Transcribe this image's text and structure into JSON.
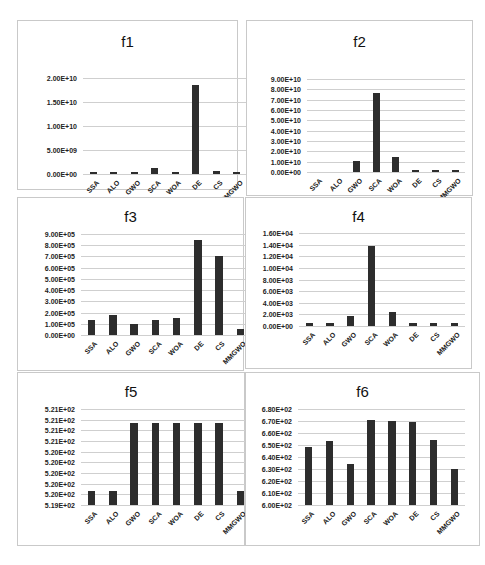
{
  "chart_data": [
    {
      "type": "bar",
      "title": "f1",
      "categories": [
        "SSA",
        "ALO",
        "GWO",
        "SCA",
        "WOA",
        "DE",
        "CS",
        "MMGWO"
      ],
      "values": [
        200000000.0,
        200000000.0,
        200000000.0,
        1200000000.0,
        200000000.0,
        18500000000.0,
        700000000.0,
        200000000.0
      ],
      "yticks": [
        "0.00E+00",
        "5.00E+09",
        "1.00E+10",
        "1.50E+10",
        "2.00E+10"
      ],
      "ylim": [
        0,
        20000000000.0
      ],
      "xlabel": "",
      "ylabel": "",
      "grid": true,
      "legend": null
    },
    {
      "type": "bar",
      "title": "f2",
      "categories": [
        "SSA",
        "ALO",
        "GWO",
        "SCA",
        "WOA",
        "DE",
        "CS",
        "MMGWO"
      ],
      "values": [
        0,
        0,
        10500000000.0,
        76000000000.0,
        15000000000.0,
        500000000.0,
        500000000.0,
        500000000.0
      ],
      "yticks": [
        "0.00E+00",
        "1.00E+10",
        "2.00E+10",
        "3.00E+10",
        "4.00E+10",
        "5.00E+10",
        "6.00E+10",
        "7.00E+10",
        "8.00E+10",
        "9.00E+10"
      ],
      "ylim": [
        0,
        90000000000.0
      ],
      "xlabel": "",
      "ylabel": "",
      "grid": true,
      "legend": null
    },
    {
      "type": "bar",
      "title": "f3",
      "categories": [
        "SSA",
        "ALO",
        "GWO",
        "SCA",
        "WOA",
        "DE",
        "CS",
        "MMGWO"
      ],
      "values": [
        135000.0,
        180000.0,
        95000.0,
        135000.0,
        150000.0,
        850000.0,
        705000.0,
        50000.0
      ],
      "yticks": [
        "0.00E+00",
        "1.00E+05",
        "2.00E+05",
        "3.00E+05",
        "4.00E+05",
        "5.00E+05",
        "6.00E+05",
        "7.00E+05",
        "8.00E+05",
        "9.00E+05"
      ],
      "ylim": [
        0,
        900000.0
      ],
      "xlabel": "",
      "ylabel": "",
      "grid": true,
      "legend": null
    },
    {
      "type": "bar",
      "title": "f4",
      "categories": [
        "SSA",
        "ALO",
        "GWO",
        "SCA",
        "WOA",
        "DE",
        "CS",
        "MMGWO"
      ],
      "values": [
        600,
        600,
        1800,
        13700,
        2400,
        600,
        600,
        450
      ],
      "yticks": [
        "0.00E+00",
        "2.00E+03",
        "4.00E+03",
        "6.00E+03",
        "8.00E+03",
        "1.00E+04",
        "1.20E+04",
        "1.40E+04",
        "1.60E+04"
      ],
      "ylim": [
        0,
        16000
      ],
      "xlabel": "",
      "ylabel": "",
      "grid": true,
      "legend": null
    },
    {
      "type": "bar",
      "title": "f5",
      "categories": [
        "SSA",
        "ALO",
        "GWO",
        "SCA",
        "WOA",
        "DE",
        "CS",
        "MMGWO"
      ],
      "values": [
        520.0,
        520.0,
        521.0,
        521.0,
        521.0,
        521.0,
        521.0,
        520.0
      ],
      "yticks": [
        "5.19E+02",
        "5.20E+02",
        "5.20E+02",
        "5.20E+02",
        "5.20E+02",
        "5.20E+02",
        "5.21E+02",
        "5.21E+02",
        "5.21E+02",
        "5.21E+02"
      ],
      "ylim": [
        519.8,
        521.2
      ],
      "xlabel": "",
      "ylabel": "",
      "grid": true,
      "legend": null
    },
    {
      "type": "bar",
      "title": "f6",
      "categories": [
        "SSA",
        "ALO",
        "GWO",
        "SCA",
        "WOA",
        "DE",
        "CS",
        "MMGWO"
      ],
      "values": [
        648,
        653,
        634,
        671,
        670,
        669,
        654,
        630
      ],
      "yticks": [
        "6.00E+02",
        "6.10E+02",
        "6.20E+02",
        "6.30E+02",
        "6.40E+02",
        "6.50E+02",
        "6.60E+02",
        "6.70E+02",
        "6.80E+02"
      ],
      "ylim": [
        600,
        680
      ],
      "xlabel": "",
      "ylabel": "",
      "grid": true,
      "legend": null
    }
  ],
  "colors": {
    "bar": "#2d2d2d",
    "grid": "#cfcfcf",
    "border": "#c9c9c9"
  }
}
